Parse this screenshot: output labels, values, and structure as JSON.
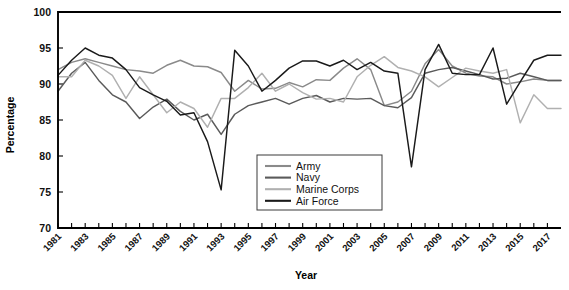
{
  "chart_data": {
    "type": "line",
    "title": "",
    "xlabel": "Year",
    "ylabel": "Percentage",
    "xlim": [
      1981,
      2018
    ],
    "ylim": [
      70,
      100
    ],
    "ytick_values": [
      70,
      75,
      80,
      85,
      90,
      95,
      100
    ],
    "ytick_labels": [
      "70",
      "75",
      "80",
      "85",
      "90",
      "95",
      "100"
    ],
    "xtick_values": [
      1981,
      1982,
      1983,
      1984,
      1985,
      1986,
      1987,
      1988,
      1989,
      1990,
      1991,
      1992,
      1993,
      1994,
      1995,
      1996,
      1997,
      1998,
      1999,
      2000,
      2001,
      2002,
      2003,
      2004,
      2005,
      2006,
      2007,
      2008,
      2009,
      2010,
      2011,
      2012,
      2013,
      2014,
      2015,
      2016,
      2017
    ],
    "xtick_labels_shown": [
      "1981",
      "1983",
      "1985",
      "1987",
      "1989",
      "1991",
      "1993",
      "1995",
      "1997",
      "1999",
      "2001",
      "2003",
      "2005",
      "2007",
      "2009",
      "2011",
      "2013",
      "2015",
      "2017"
    ],
    "grid": false,
    "legend_position": "lower-center-right",
    "x": [
      1981,
      1982,
      1983,
      1984,
      1985,
      1986,
      1987,
      1988,
      1989,
      1990,
      1991,
      1992,
      1993,
      1994,
      1995,
      1996,
      1997,
      1998,
      1999,
      2000,
      2001,
      2002,
      2003,
      2004,
      2005,
      2006,
      2007,
      2008,
      2009,
      2010,
      2011,
      2012,
      2013,
      2014,
      2015,
      2016,
      2017,
      2018
    ],
    "series": [
      {
        "name": "Army",
        "color": "#8a8a8a",
        "values": [
          92.0,
          93.0,
          93.5,
          93.0,
          92.5,
          92.0,
          91.8,
          91.5,
          92.6,
          93.3,
          92.5,
          92.4,
          91.6,
          89.0,
          90.5,
          89.3,
          89.4,
          90.2,
          89.6,
          90.6,
          90.5,
          92.2,
          93.5,
          92.0,
          87.0,
          87.5,
          89.0,
          92.8,
          94.8,
          92.5,
          91.5,
          91.1,
          91.0,
          90.0,
          90.3,
          90.7,
          90.5,
          90.5
        ]
      },
      {
        "name": "Navy",
        "color": "#5a5a5a",
        "values": [
          89.0,
          91.5,
          93.0,
          90.5,
          88.5,
          87.5,
          85.2,
          86.8,
          87.9,
          86.2,
          85.0,
          85.8,
          83.0,
          85.8,
          87.0,
          87.5,
          88.0,
          87.2,
          88.0,
          88.4,
          87.5,
          88.0,
          87.9,
          88.0,
          87.0,
          86.7,
          88.1,
          91.5,
          92.0,
          92.3,
          91.8,
          91.3,
          90.7,
          90.8,
          91.5,
          91.0,
          90.5,
          90.5
        ]
      },
      {
        "name": "Marine Corps",
        "color": "#b0b0b0",
        "values": [
          91.0,
          91.0,
          93.3,
          92.5,
          91.2,
          88.0,
          91.0,
          88.5,
          86.0,
          87.5,
          86.6,
          84.0,
          88.0,
          88.0,
          89.5,
          91.5,
          89.0,
          90.0,
          88.8,
          87.9,
          88.0,
          87.5,
          91.0,
          92.6,
          93.8,
          92.3,
          91.8,
          91.0,
          89.6,
          90.9,
          92.2,
          91.8,
          91.5,
          92.0,
          84.6,
          88.5,
          86.6,
          86.6
        ]
      },
      {
        "name": "Air Force",
        "color": "#1a1a1a",
        "values": [
          91.2,
          93.3,
          95.0,
          94.0,
          93.6,
          92.0,
          89.5,
          88.5,
          87.6,
          85.7,
          86.0,
          82.0,
          75.3,
          94.7,
          92.5,
          89.0,
          90.5,
          92.2,
          93.2,
          93.2,
          92.5,
          93.3,
          92.0,
          93.0,
          91.8,
          91.5,
          78.5,
          92.0,
          95.5,
          91.5,
          91.3,
          91.3,
          95.0,
          87.2,
          90.3,
          93.3,
          94.0,
          94.0
        ]
      }
    ]
  },
  "legend": {
    "entries": [
      {
        "label": "Army"
      },
      {
        "label": "Navy"
      },
      {
        "label": "Marine Corps"
      },
      {
        "label": "Air Force"
      }
    ]
  }
}
